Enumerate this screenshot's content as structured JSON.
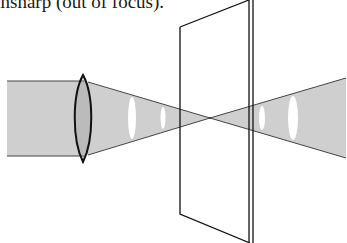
{
  "caption": {
    "text": "unsharp (out of focus)."
  },
  "diagram": {
    "elements": [
      {
        "name": "incoming-parallel-beam",
        "label": ""
      },
      {
        "name": "convex-lens",
        "label": ""
      },
      {
        "name": "converging-cone",
        "label": ""
      },
      {
        "name": "focal-point",
        "label": ""
      },
      {
        "name": "diverging-cone",
        "label": ""
      },
      {
        "name": "image-plane",
        "label": ""
      }
    ],
    "colors": {
      "beam_fill": "#cfcfcf",
      "stroke": "#1a1a1a",
      "highlight": "#ffffff",
      "background": "#ffffff"
    }
  }
}
